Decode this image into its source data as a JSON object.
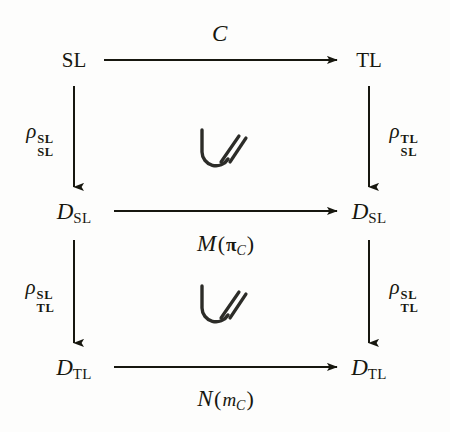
{
  "diagram": {
    "type": "commutative-diagram",
    "nodes": [
      {
        "id": "sl",
        "base": "SL",
        "sub": "",
        "style": "upright",
        "x": 74,
        "y": 60
      },
      {
        "id": "tl",
        "base": "TL",
        "sub": "",
        "style": "upright",
        "x": 369,
        "y": 60
      },
      {
        "id": "d-sl-left",
        "base": "D",
        "sub": "SL",
        "style": "italic",
        "x": 74,
        "y": 211
      },
      {
        "id": "d-sl-right",
        "base": "D",
        "sub": "SL",
        "style": "italic",
        "x": 369,
        "y": 211
      },
      {
        "id": "d-tl-left",
        "base": "D",
        "sub": "TL",
        "style": "italic",
        "x": 74,
        "y": 367
      },
      {
        "id": "d-tl-right",
        "base": "D",
        "sub": "TL",
        "style": "italic",
        "x": 369,
        "y": 367
      }
    ],
    "horizontal_arrows": [
      {
        "id": "top",
        "from": "sl",
        "to": "tl",
        "x1": 104,
        "x2": 337,
        "y": 60,
        "label_x": 220,
        "label_y": 33
      },
      {
        "id": "middle",
        "from": "d-sl-left",
        "to": "d-sl-right",
        "x1": 114,
        "x2": 337,
        "y": 211,
        "label_x": 226,
        "label_y": 243
      },
      {
        "id": "bottom",
        "from": "d-tl-left",
        "to": "d-tl-right",
        "x1": 114,
        "x2": 337,
        "y": 367,
        "label_x": 226,
        "label_y": 398
      }
    ],
    "vertical_arrows": [
      {
        "id": "left-upper",
        "x": 74,
        "y1": 86,
        "y2": 187,
        "label_x": 40,
        "label_y": 140
      },
      {
        "id": "right-upper",
        "x": 369,
        "y1": 86,
        "y2": 187,
        "label_x": 404,
        "label_y": 140
      },
      {
        "id": "left-lower",
        "x": 74,
        "y1": 240,
        "y2": 343,
        "label_x": 40,
        "label_y": 296
      },
      {
        "id": "right-lower",
        "x": 369,
        "y1": 240,
        "y2": 343,
        "label_x": 404,
        "label_y": 296
      }
    ],
    "arrow_labels": {
      "top": {
        "text": "C",
        "kind": "calligraphic"
      },
      "middle": {
        "functor": "M",
        "open": "(",
        "arg": "π",
        "arg_sub": "C",
        "close": ")"
      },
      "bottom": {
        "functor": "N",
        "open": "(",
        "arg": "m",
        "arg_sub": "C",
        "close": ")"
      }
    },
    "rho_labels": {
      "left_upper": {
        "glyph": "ρ",
        "sup": "SL",
        "sub": "SL"
      },
      "right_upper": {
        "glyph": "ρ",
        "sup": "TL",
        "sub": "SL"
      },
      "left_lower": {
        "glyph": "ρ",
        "sup": "SL",
        "sub": "TL"
      },
      "right_lower": {
        "glyph": "ρ",
        "sup": "SL",
        "sub": "TL"
      }
    },
    "commute_symbols": [
      {
        "id": "upper",
        "x": 222,
        "y": 150,
        "meaning": "commutes-up-to-isomorphism"
      },
      {
        "id": "lower",
        "x": 222,
        "y": 306,
        "meaning": "commutes-up-to-isomorphism"
      }
    ],
    "colors": {
      "ink": "#17170f",
      "background": "#fdfdfc"
    }
  }
}
